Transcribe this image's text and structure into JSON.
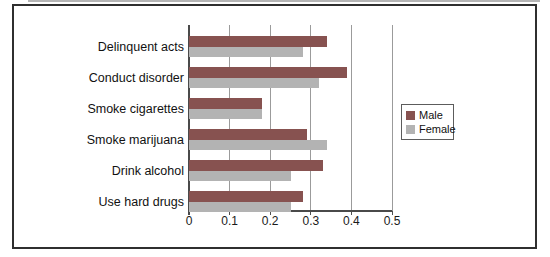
{
  "chart_data": {
    "type": "bar",
    "orientation": "horizontal",
    "title": "",
    "xlabel": "",
    "ylabel": "",
    "xlim": [
      0,
      0.5
    ],
    "xticks": [
      "0",
      "0.1",
      "0.2",
      "0.3",
      "0.4",
      "0.5"
    ],
    "grid": "vertical gridlines on",
    "legend_position": "right",
    "categories": [
      "Delinquent acts",
      "Conduct disorder",
      "Smoke cigarettes",
      "Smoke marijuana",
      "Drink alcohol",
      "Use hard drugs"
    ],
    "series": [
      {
        "name": "Male",
        "color": "#875250",
        "values": [
          0.34,
          0.39,
          0.18,
          0.29,
          0.33,
          0.28
        ]
      },
      {
        "name": "Female",
        "color": "#b3b3b3",
        "values": [
          0.28,
          0.32,
          0.18,
          0.34,
          0.25,
          0.25
        ]
      }
    ]
  },
  "colors": {
    "frame_border": "#2f2f2f",
    "gridline": "#9b9b9b",
    "axis": "#4a4a4a",
    "male_bar": "#875250",
    "female_bar": "#b3b3b3"
  }
}
